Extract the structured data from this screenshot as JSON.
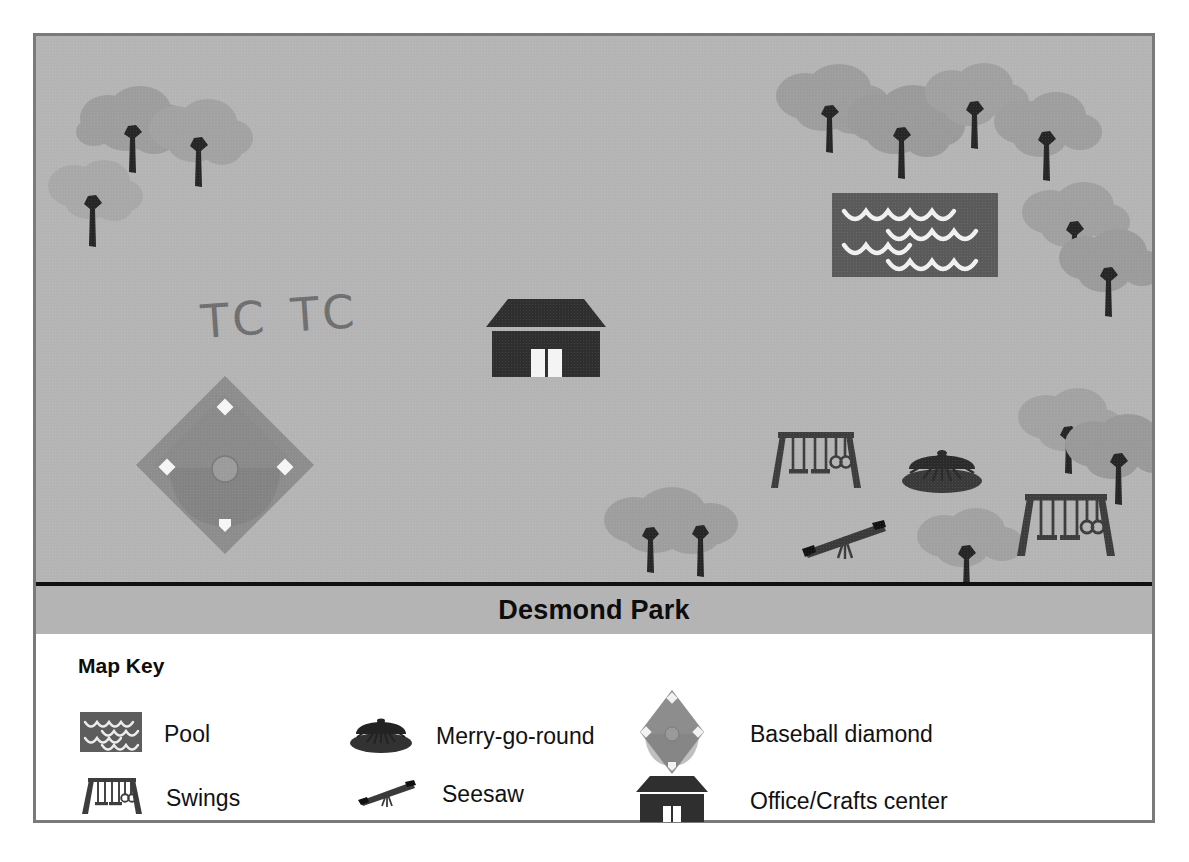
{
  "map": {
    "title": "Desmond Park",
    "annotation": "TC TC",
    "background_color": "#b4b4b4",
    "features": [
      {
        "name": "tree",
        "label": "Tree",
        "x": 62,
        "y": 22
      },
      {
        "name": "tree",
        "label": "Tree",
        "x": 112,
        "y": 40
      },
      {
        "name": "tree",
        "label": "Tree",
        "x": 30,
        "y": 95
      },
      {
        "name": "tree",
        "label": "Tree",
        "x": 740,
        "y": 18
      },
      {
        "name": "tree",
        "label": "Tree",
        "x": 810,
        "y": 42
      },
      {
        "name": "tree",
        "label": "Tree",
        "x": 890,
        "y": 18
      },
      {
        "name": "tree",
        "label": "Tree",
        "x": 950,
        "y": 48
      },
      {
        "name": "tree",
        "label": "Tree",
        "x": 985,
        "y": 140
      },
      {
        "name": "tree",
        "label": "Tree",
        "x": 1030,
        "y": 185
      },
      {
        "name": "tree",
        "label": "Tree",
        "x": 985,
        "y": 345
      },
      {
        "name": "tree",
        "label": "Tree",
        "x": 1030,
        "y": 372
      },
      {
        "name": "tree",
        "label": "Tree",
        "x": 565,
        "y": 445
      },
      {
        "name": "tree",
        "label": "Tree",
        "x": 625,
        "y": 455
      },
      {
        "name": "tree",
        "label": "Tree",
        "x": 880,
        "y": 472
      },
      {
        "name": "pool",
        "label": "Pool",
        "x": 796,
        "y": 157
      },
      {
        "name": "office-crafts-center",
        "label": "Office/Crafts center",
        "x": 450,
        "y": 263
      },
      {
        "name": "baseball-diamond",
        "label": "Baseball diamond",
        "x": 100,
        "y": 340
      },
      {
        "name": "swings",
        "label": "Swings",
        "x": 730,
        "y": 390
      },
      {
        "name": "swings",
        "label": "Swings",
        "x": 976,
        "y": 452
      },
      {
        "name": "merry-go-round",
        "label": "Merry-go-round",
        "x": 863,
        "y": 405
      },
      {
        "name": "seesaw",
        "label": "Seesaw",
        "x": 762,
        "y": 475
      }
    ]
  },
  "key": {
    "title": "Map Key",
    "items": [
      {
        "icon": "pool-icon",
        "label": "Pool"
      },
      {
        "icon": "merry-go-round-icon",
        "label": "Merry-go-round"
      },
      {
        "icon": "baseball-diamond-icon",
        "label": "Baseball diamond"
      },
      {
        "icon": "swings-icon",
        "label": "Swings"
      },
      {
        "icon": "seesaw-icon",
        "label": "Seesaw"
      },
      {
        "icon": "office-crafts-icon",
        "label": "Office/Crafts center"
      }
    ]
  },
  "compass": {
    "north": "N",
    "south": "S",
    "east": "E",
    "west": "W",
    "northwest": "NW",
    "northeast": "NE",
    "southwest": "SW",
    "southeast": "SE"
  },
  "colors": {
    "map_background": "#b4b4b4",
    "tree_canopy": "#9a9a9a",
    "tree_trunk": "#2b2b2b",
    "dark_feature": "#3a3a3a",
    "pool_fill": "#5a5a5a",
    "diamond_fill": "#8c8c8c",
    "frame_border": "#7a7a7a",
    "title_text": "#0d0d0d"
  }
}
